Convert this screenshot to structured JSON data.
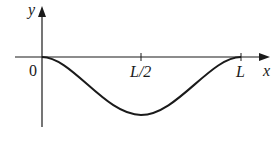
{
  "diagram": {
    "type": "function-plot",
    "axes": {
      "x_label": "x",
      "y_label": "y",
      "origin_label": "0"
    },
    "ticks": [
      {
        "label": "L/2",
        "position": "midpoint"
      },
      {
        "label": "L",
        "position": "end"
      }
    ],
    "curve": {
      "description": "Smooth downward dip from (0,0) to (L,0) with minimum at x = L/2",
      "color": "#1a1a1a"
    },
    "colors": {
      "axis": "#1a1a1a",
      "background": "#ffffff"
    }
  }
}
